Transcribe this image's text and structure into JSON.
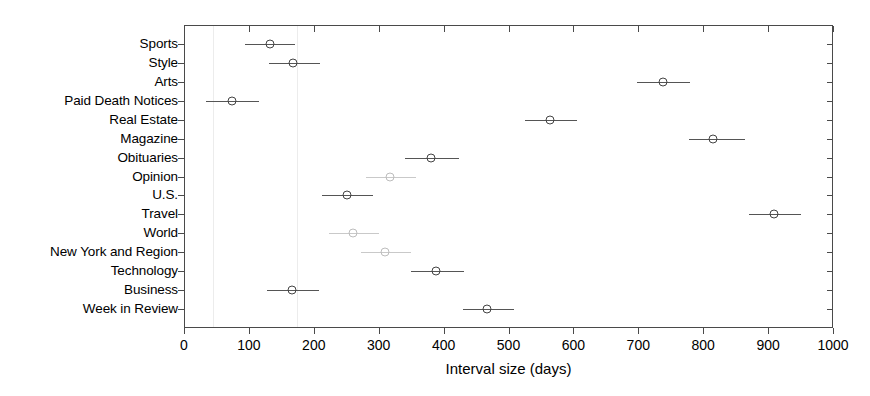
{
  "chart_data": {
    "type": "scatter",
    "title": "",
    "xlabel": "Interval size (days)",
    "ylabel": "",
    "xlim": [
      0,
      1000
    ],
    "xticks": [
      0,
      100,
      200,
      300,
      400,
      500,
      600,
      700,
      800,
      900,
      1000
    ],
    "xticklabels": [
      "0",
      "100",
      "200",
      "300",
      "400",
      "500",
      "600",
      "700",
      "800",
      "900",
      "1000"
    ],
    "grid": false,
    "legend": null,
    "orientation": "horizontal",
    "marker_style": "open-circle",
    "categories": [
      "Sports",
      "Style",
      "Arts",
      "Paid Death Notices",
      "Real Estate",
      "Magazine",
      "Obituaries",
      "Opinion",
      "U.S.",
      "Travel",
      "World",
      "New York and Region",
      "Technology",
      "Business",
      "Week in Review"
    ],
    "points": [
      {
        "category": "Sports",
        "value": 132,
        "low": 94,
        "high": 171,
        "ink": "normal"
      },
      {
        "category": "Style",
        "value": 168,
        "low": 131,
        "high": 210,
        "ink": "normal"
      },
      {
        "category": "Arts",
        "value": 738,
        "low": 698,
        "high": 780,
        "ink": "normal"
      },
      {
        "category": "Paid Death Notices",
        "value": 74,
        "low": 34,
        "high": 115,
        "ink": "normal"
      },
      {
        "category": "Real Estate",
        "value": 564,
        "low": 525,
        "high": 605,
        "ink": "normal"
      },
      {
        "category": "Magazine",
        "value": 815,
        "low": 778,
        "high": 864,
        "ink": "normal"
      },
      {
        "category": "Obituaries",
        "value": 381,
        "low": 340,
        "high": 424,
        "ink": "normal"
      },
      {
        "category": "Opinion",
        "value": 317,
        "low": 280,
        "high": 358,
        "ink": "faded"
      },
      {
        "category": "U.S.",
        "value": 251,
        "low": 213,
        "high": 291,
        "ink": "normal"
      },
      {
        "category": "Travel",
        "value": 909,
        "low": 870,
        "high": 950,
        "ink": "normal"
      },
      {
        "category": "World",
        "value": 260,
        "low": 224,
        "high": 300,
        "ink": "faded"
      },
      {
        "category": "New York and Region",
        "value": 310,
        "low": 273,
        "high": 350,
        "ink": "faded"
      },
      {
        "category": "Technology",
        "value": 388,
        "low": 350,
        "high": 432,
        "ink": "normal"
      },
      {
        "category": "Business",
        "value": 166,
        "low": 128,
        "high": 208,
        "ink": "normal"
      },
      {
        "category": "Week in Review",
        "value": 467,
        "low": 430,
        "high": 508,
        "ink": "normal"
      }
    ]
  }
}
